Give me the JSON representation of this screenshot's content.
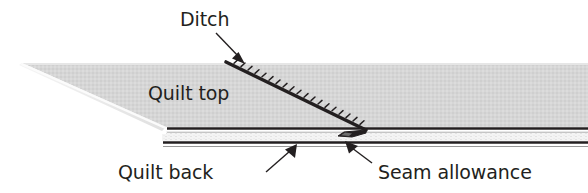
{
  "diagram": {
    "colors": {
      "quilt_top_fill": "#d4d4d4",
      "quilt_top_edge_light": "#efefef",
      "line_dark": "#231f20",
      "background": "#ffffff",
      "batting_fill": "#f2f2f2"
    },
    "labels": {
      "ditch": "Ditch",
      "quilt_top": "Quilt top",
      "quilt_back": "Quilt back",
      "seam_allowance": "Seam allowance"
    },
    "parts": {
      "quilt_top_surface": "quilt-top-surface",
      "ditch_stitch_line": "ditch-stitch-line",
      "seam_allowance_fold": "seam-allowance-fold",
      "quilt_back_layer": "quilt-back-layer",
      "batting_layer": "batting-layer"
    }
  }
}
